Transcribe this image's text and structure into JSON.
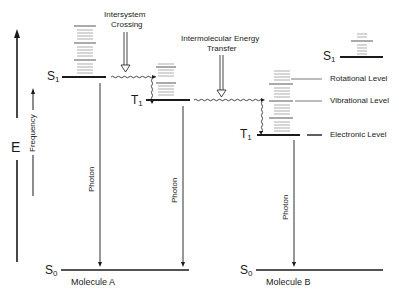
{
  "diagram": {
    "axis": {
      "energy_label": "E",
      "frequency_label": "Frequency"
    },
    "annotations": {
      "intersystem_crossing": [
        "Intersystem",
        "Crossing"
      ],
      "energy_transfer": [
        "Intermolecular Energy",
        "Transfer"
      ]
    },
    "molecule_a": {
      "name": "Molecule A",
      "s1": {
        "letter": "S",
        "sub": "1"
      },
      "t1": {
        "letter": "T",
        "sub": "1"
      },
      "s0": {
        "letter": "S",
        "sub": "0"
      },
      "photon_labels": [
        "Photon",
        "Photon"
      ]
    },
    "molecule_b": {
      "name": "Molecule B",
      "s1": {
        "letter": "S",
        "sub": "1"
      },
      "t1": {
        "letter": "T",
        "sub": "1"
      },
      "s0": {
        "letter": "S",
        "sub": "0"
      },
      "photon_label": "Photon"
    },
    "legend": {
      "rotational": "Rotational Level",
      "vibrational": "Vibrational Level",
      "electronic": "Electronic Level"
    },
    "colors": {
      "ink": "#1a1a1a",
      "faint": "#9a9a9a",
      "background": "#ffffff"
    }
  }
}
